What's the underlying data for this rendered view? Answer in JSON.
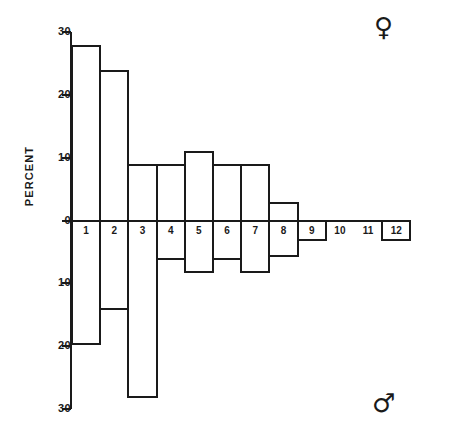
{
  "chart_data": {
    "type": "bar",
    "title": "",
    "subtitle": "",
    "xlabel": "",
    "ylabel": "PERCENT",
    "orientation": "vertical",
    "style": "back-to-back population pyramid (outline bars, no fill)",
    "grid": false,
    "legend": false,
    "categories": [
      "1",
      "2",
      "3",
      "4",
      "5",
      "6",
      "7",
      "8",
      "9",
      "10",
      "11",
      "12"
    ],
    "axis": {
      "ylim": [
        -30,
        30
      ],
      "tick_values": [
        30,
        20,
        10,
        0,
        -10,
        -20,
        -30
      ],
      "tick_labels": [
        "30",
        "20",
        "10",
        "0",
        "10",
        "20",
        "30"
      ],
      "note": "lower half tick labels show absolute magnitude"
    },
    "series": [
      {
        "name": "Female",
        "symbol": "♀",
        "direction": "up",
        "values": [
          28,
          24,
          9,
          9,
          11,
          9,
          9,
          3,
          0,
          0,
          0,
          0
        ]
      },
      {
        "name": "Male",
        "symbol": "♂",
        "direction": "down",
        "values": [
          19.5,
          14,
          28,
          6,
          8,
          6,
          8,
          5.5,
          3,
          0,
          0,
          3
        ]
      }
    ]
  },
  "annotations": {
    "female_symbol": "♀",
    "male_symbol": "♂",
    "female_symbol_name": "venus-symbol",
    "male_symbol_name": "mars-symbol"
  },
  "colors": {
    "ink": "#1a1a1a",
    "background": "#ffffff"
  }
}
